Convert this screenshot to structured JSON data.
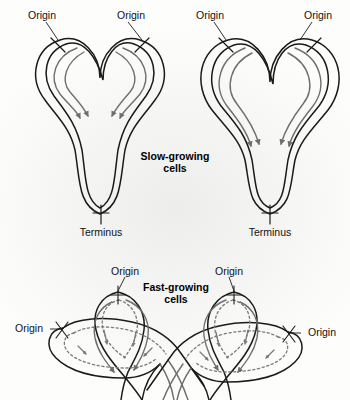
{
  "figure": {
    "background_color": "#f4f4f3",
    "strand_color": "#1a1a1a",
    "fork_color": "#6e6e6e",
    "dotted_color": "#7a7a7a",
    "text_color": "#111111"
  },
  "panels": [
    {
      "id": "slow-growing",
      "caption": "Slow-growing\ncells",
      "caption_line1": "Slow-growing",
      "caption_line2": "cells",
      "caption_x": 175,
      "caption_y": 160,
      "cells": [
        {
          "id": "slow-left",
          "labels": [
            {
              "name": "origin-label-slow-left-1",
              "text": "Origin",
              "x": 42,
              "y": 16,
              "anchor": "middle",
              "leader": "M 46,20 L 58,38"
            },
            {
              "name": "origin-label-slow-left-2",
              "text": "Origin",
              "x": 131,
              "y": 16,
              "anchor": "middle",
              "leader": "M 127,20 L 114,38"
            },
            {
              "name": "terminus-label-slow-left",
              "text": "Terminus",
              "x": 101,
              "y": 232,
              "anchor": "middle",
              "leader": ""
            }
          ]
        },
        {
          "id": "slow-right",
          "labels": [
            {
              "name": "origin-label-slow-right-1",
              "text": "Origin",
              "x": 210,
              "y": 16,
              "anchor": "middle",
              "leader": "M 214,20 L 226,38"
            },
            {
              "name": "origin-label-slow-right-2",
              "text": "Origin",
              "x": 318,
              "y": 16,
              "anchor": "middle",
              "leader": "M 314,20 L 300,38"
            },
            {
              "name": "terminus-label-slow-right",
              "text": "Terminus",
              "x": 270,
              "y": 232,
              "anchor": "middle",
              "leader": ""
            }
          ]
        }
      ]
    },
    {
      "id": "fast-growing",
      "caption": "Fast-growing\ncells",
      "caption_line1": "Fast-growing",
      "caption_line2": "cells",
      "caption_x": 175,
      "caption_y": 288,
      "cells": [
        {
          "id": "fast-left",
          "labels": [
            {
              "name": "origin-label-fast-left-top",
              "text": "Origin",
              "x": 125,
              "y": 272,
              "anchor": "middle",
              "leader": "M 125,276 L 118,293"
            },
            {
              "name": "origin-label-fast-left-side",
              "text": "Origin",
              "x": 31,
              "y": 329,
              "anchor": "middle",
              "leader": "M 52,326 L 63,329"
            }
          ]
        },
        {
          "id": "fast-right",
          "labels": [
            {
              "name": "origin-label-fast-right-top",
              "text": "Origin",
              "x": 229,
              "y": 272,
              "anchor": "middle",
              "leader": "M 229,276 L 234,293"
            },
            {
              "name": "origin-label-fast-right-side",
              "text": "Origin",
              "x": 320,
              "y": 333,
              "anchor": "middle",
              "leader": "M 299,330 L 288,333"
            }
          ]
        }
      ]
    }
  ],
  "legend_semantics": {
    "origin": "Origin of replication (oriC)",
    "terminus": "Terminus of replication (ter)",
    "fork_arrow": "Replication fork direction",
    "solid_strand": "Chromosome / first round of replication",
    "dotted_strand": "Second (nested) round of replication"
  }
}
